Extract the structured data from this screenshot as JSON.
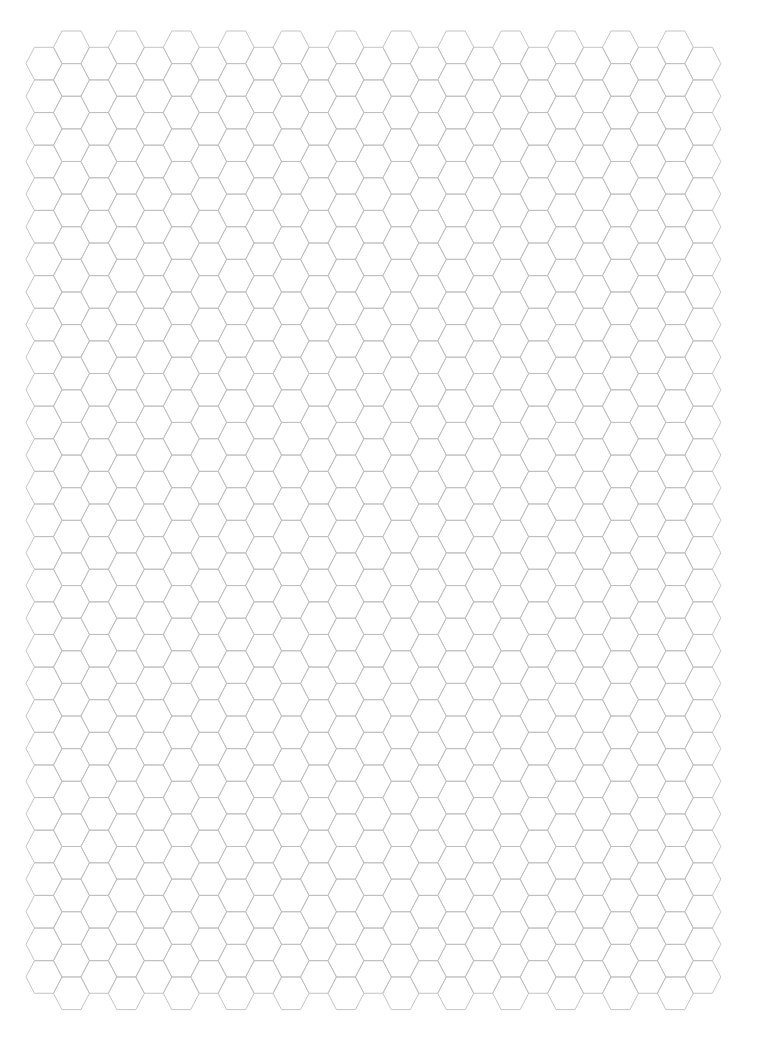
{
  "page": {
    "type": "hexagonal graph paper",
    "width": 765,
    "height": 1050,
    "background": "#ffffff"
  },
  "grid": {
    "orientation": "flat-top",
    "columns": 25,
    "line_color": "#bdbdbd",
    "line_width": 0.9,
    "hex_width": 36,
    "hex_inset": 8.5,
    "row_pitch": 32.62,
    "column_pitch": 27.45,
    "first_column_center_x": 44,
    "low_columns": {
      "parity": "even",
      "first_top_y": 47.3,
      "hex_count": 29
    },
    "high_columns": {
      "parity": "odd",
      "first_top_y": 31.0,
      "hex_count": 30
    }
  }
}
